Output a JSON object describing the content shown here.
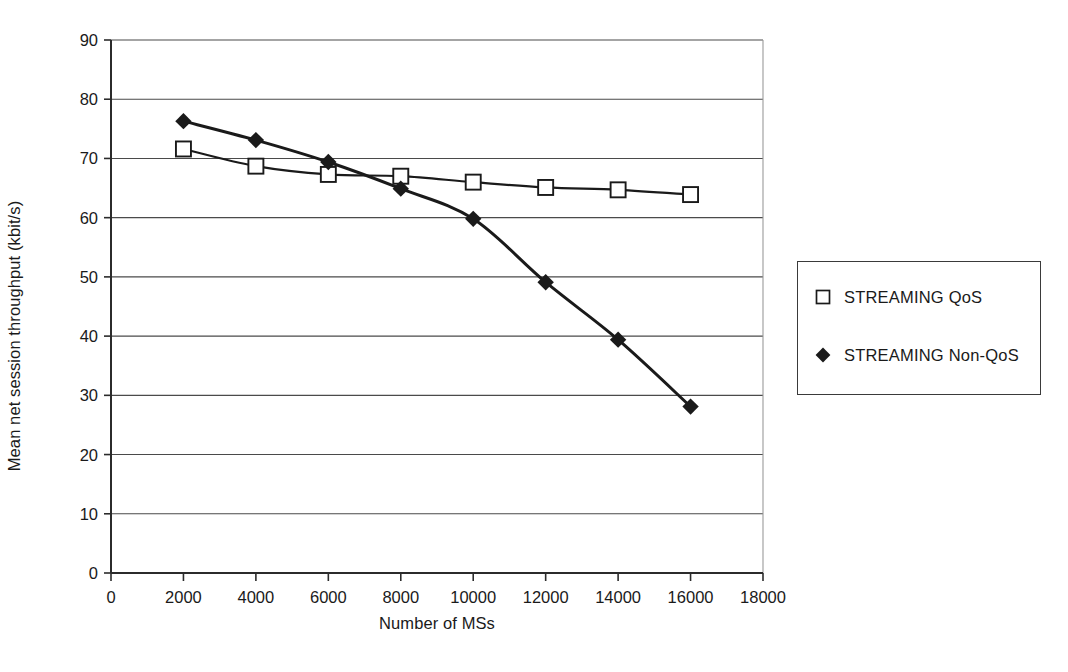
{
  "chart_data": {
    "type": "line",
    "title": "",
    "xlabel": "Number of MSs",
    "ylabel": "Mean net session throughput (kbit/s)",
    "xlim": [
      0,
      18000
    ],
    "ylim": [
      0,
      90
    ],
    "xticks": [
      0,
      2000,
      4000,
      6000,
      8000,
      10000,
      12000,
      14000,
      16000,
      18000
    ],
    "yticks": [
      0,
      10,
      20,
      30,
      40,
      50,
      60,
      70,
      80,
      90
    ],
    "xtick_labels": [
      "0",
      "2000",
      "4000",
      "6000",
      "8000",
      "10000",
      "12000",
      "14000",
      "16000",
      "18000"
    ],
    "ytick_labels": [
      "0",
      "10",
      "20",
      "30",
      "40",
      "50",
      "60",
      "70",
      "80",
      "90"
    ],
    "grid": "horizontal",
    "legend_position": "right-outside",
    "x": [
      2000,
      4000,
      6000,
      8000,
      10000,
      12000,
      14000,
      16000
    ],
    "series": [
      {
        "name": "STREAMING QoS",
        "marker": "open-square",
        "color": "#1a1a1a",
        "values": [
          71.6,
          68.7,
          67.3,
          67.0,
          66.0,
          65.1,
          64.7,
          63.9
        ]
      },
      {
        "name": "STREAMING Non-QoS",
        "marker": "filled-diamond",
        "color": "#1a1a1a",
        "values": [
          76.3,
          73.1,
          69.4,
          64.9,
          59.8,
          49.1,
          39.4,
          28.1
        ]
      }
    ]
  },
  "legend": {
    "entries": [
      {
        "label": "STREAMING QoS",
        "marker": "open-square"
      },
      {
        "label": "STREAMING Non-QoS",
        "marker": "filled-diamond"
      }
    ]
  },
  "axes": {
    "x_title": "Number of MSs",
    "y_title": "Mean net session throughput (kbit/s)"
  }
}
